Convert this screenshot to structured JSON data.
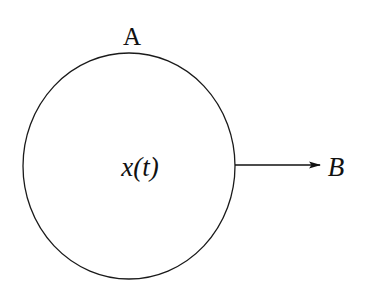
{
  "diagram": {
    "node": {
      "label_top": "A",
      "label_center": "x(t)",
      "center_var": "x",
      "center_arg": "t"
    },
    "output": {
      "label": "B"
    },
    "colors": {
      "stroke": "#1a1a1a",
      "background": "#ffffff"
    }
  }
}
